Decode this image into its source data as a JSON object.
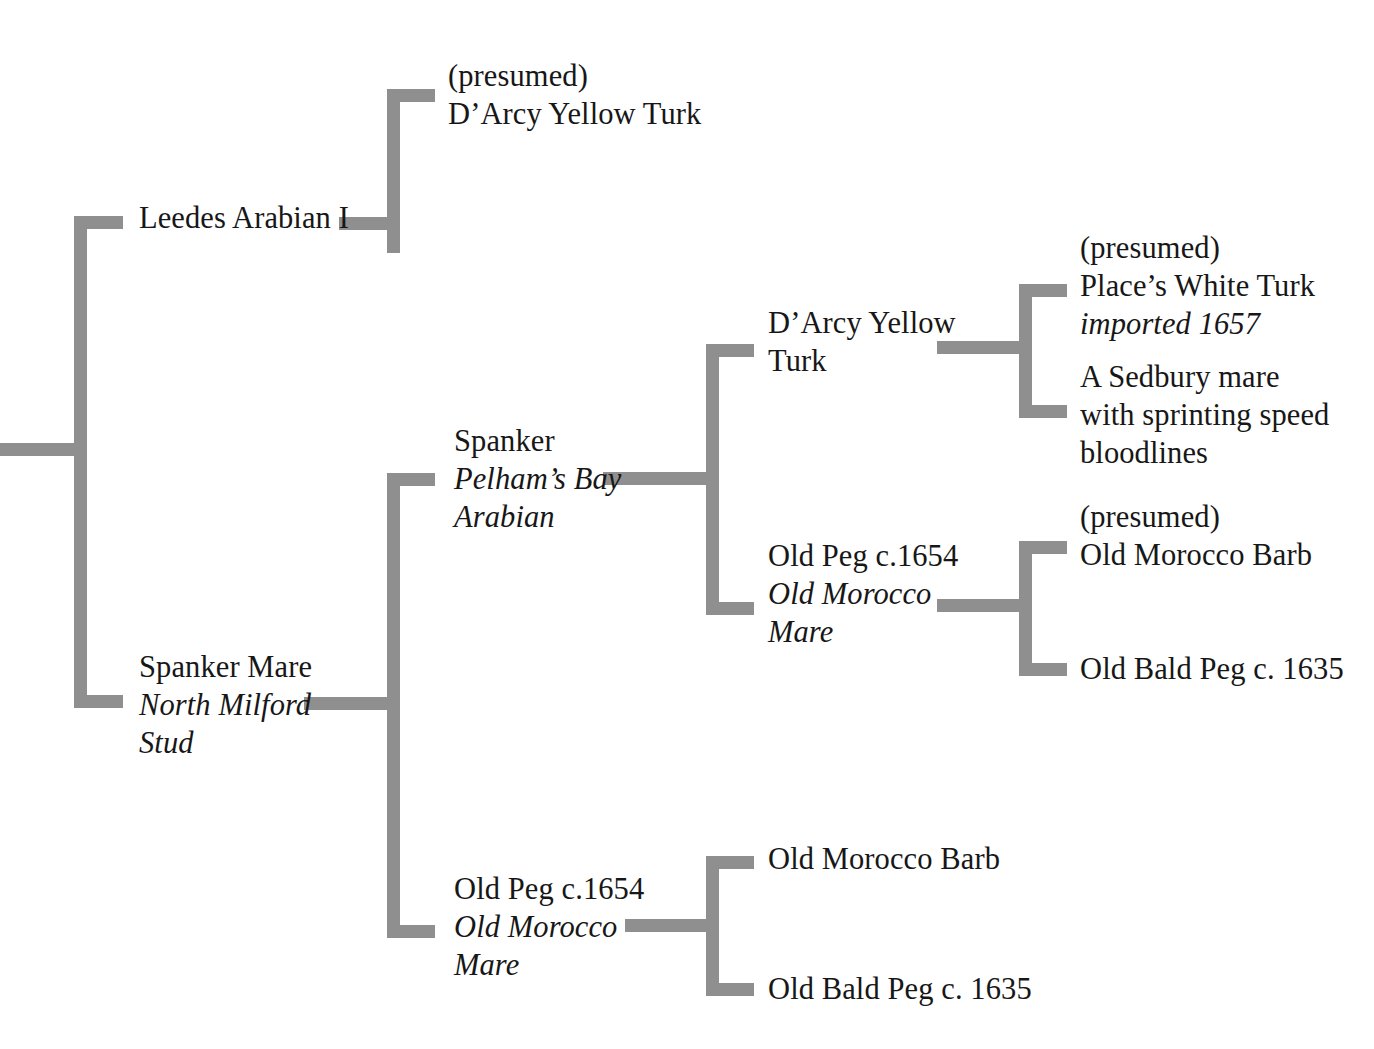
{
  "diagram": {
    "kind": "pedigree-chart",
    "line_color": "#8f8f8f",
    "text_color": "#171717",
    "background_color": "#ffffff"
  },
  "nodes": {
    "leedes_arabian": {
      "name": "Leedes Arabian I",
      "lines": [
        "Leedes Arabian I"
      ]
    },
    "darcy_yellow_turk_top": {
      "name": "(presumed) D'Arcy Yellow Turk",
      "line1": "(presumed)",
      "line2": "D’Arcy Yellow Turk"
    },
    "spanker": {
      "name": "Spanker",
      "line1": "Spanker",
      "line2": "Pelham’s Bay",
      "line3": "Arabian"
    },
    "spanker_mare": {
      "name": "Spanker Mare",
      "line1": "Spanker Mare",
      "line2": "North Milford",
      "line3": "Stud"
    },
    "darcy_yellow_turk_mid": {
      "name": "D'Arcy Yellow Turk",
      "line1": "D’Arcy Yellow",
      "line2": "Turk"
    },
    "old_peg_mid": {
      "name": "Old Peg c.1654",
      "line1": "Old Peg c.1654",
      "line2": "Old Morocco",
      "line3": "Mare"
    },
    "old_peg_bottom": {
      "name": "Old Peg c.1654",
      "line1": "Old Peg c.1654",
      "line2": "Old Morocco",
      "line3": "Mare"
    },
    "places_white_turk": {
      "name": "(presumed) Place's White Turk",
      "line1": "(presumed)",
      "line2": "Place’s White Turk",
      "line3": "imported 1657"
    },
    "sedbury_mare": {
      "name": "A Sedbury mare with sprinting speed bloodlines",
      "line1": "A Sedbury mare",
      "line2": "with sprinting speed",
      "line3": "bloodlines"
    },
    "old_morocco_barb_presumed": {
      "name": "(presumed) Old Morocco Barb",
      "line1": "(presumed)",
      "line2": "Old Morocco Barb"
    },
    "old_bald_peg_mid": {
      "name": "Old Bald Peg c. 1635",
      "line1": "Old Bald Peg c. 1635"
    },
    "old_morocco_barb_bottom": {
      "name": "Old Morocco Barb",
      "line1": "Old Morocco Barb"
    },
    "old_bald_peg_bottom": {
      "name": "Old Bald Peg c. 1635",
      "line1": "Old Bald Peg c. 1635"
    }
  }
}
